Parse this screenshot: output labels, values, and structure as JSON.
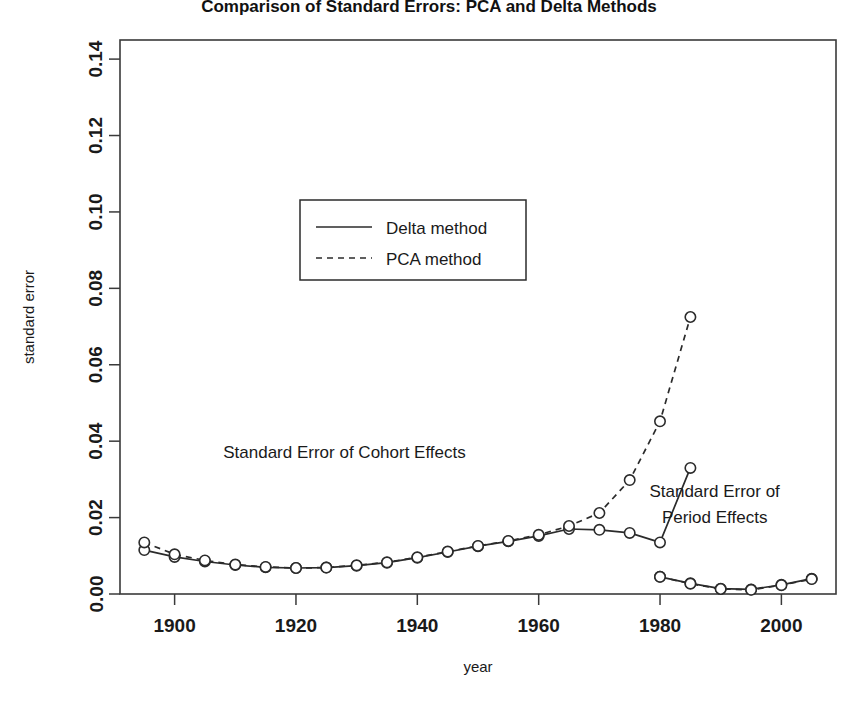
{
  "chart_data": {
    "type": "line",
    "title": "Comparison of Standard Errors: PCA and Delta Methods",
    "xlabel": "year",
    "ylabel": "standard error",
    "xlim": [
      1891,
      2009
    ],
    "ylim": [
      0.0,
      0.145
    ],
    "xticks": [
      1900,
      1920,
      1940,
      1960,
      1980,
      2000
    ],
    "xtick_labels": [
      "1900",
      "1920",
      "1940",
      "1960",
      "1980",
      "2000"
    ],
    "yticks": [
      0.0,
      0.02,
      0.04,
      0.06,
      0.08,
      0.1,
      0.12,
      0.14
    ],
    "ytick_labels": [
      "0.00",
      "0.02",
      "0.04",
      "0.06",
      "0.08",
      "0.10",
      "0.12",
      "0.14"
    ],
    "grid": false,
    "legend": {
      "position": "upper-center-left",
      "entries": [
        {
          "label": "Delta method",
          "style": "solid"
        },
        {
          "label": "PCA method",
          "style": "dashed"
        }
      ]
    },
    "annotations": [
      {
        "text": "Standard Error of Cohort Effects",
        "x": 1928,
        "y": 0.0355
      },
      {
        "text": "Standard Error of",
        "x": 1989,
        "y": 0.0255
      },
      {
        "text": "Period Effects",
        "x": 1989,
        "y": 0.0185
      }
    ],
    "groups": [
      {
        "name": "Cohort Effects",
        "x": [
          1895,
          1900,
          1905,
          1910,
          1915,
          1920,
          1925,
          1930,
          1935,
          1940,
          1945,
          1950,
          1955,
          1960,
          1965,
          1970,
          1975,
          1980,
          1985
        ],
        "series": [
          {
            "name": "Delta method",
            "style": "solid",
            "values": [
              0.0115,
              0.0097,
              0.0085,
              0.0076,
              0.007,
              0.0068,
              0.0069,
              0.0074,
              0.0082,
              0.0095,
              0.011,
              0.0125,
              0.0138,
              0.0152,
              0.017,
              0.0168,
              0.016,
              0.0135,
              0.033,
              0.108
            ]
          },
          {
            "name": "PCA method",
            "style": "dashed",
            "values": [
              0.0135,
              0.0104,
              0.0088,
              0.0077,
              0.0071,
              0.0068,
              0.0069,
              0.0075,
              0.0083,
              0.0096,
              0.0111,
              0.0126,
              0.0139,
              0.0155,
              0.0178,
              0.0212,
              0.0298,
              0.0452,
              0.0725,
              0.1388
            ]
          }
        ]
      },
      {
        "name": "Period Effects",
        "x": [
          1980,
          1985,
          1990,
          1995,
          2000,
          2005
        ],
        "series": [
          {
            "name": "Delta method",
            "style": "solid",
            "values": [
              0.0045,
              0.0028,
              0.0014,
              0.0012,
              0.0024,
              0.004
            ]
          },
          {
            "name": "PCA method",
            "style": "dashed",
            "values": [
              0.0045,
              0.0027,
              0.0013,
              0.0011,
              0.0023,
              0.0039
            ]
          }
        ]
      }
    ]
  },
  "colors": {
    "line": "#2b2b2b",
    "frame": "#3a3a3a",
    "background": "#ffffff"
  }
}
